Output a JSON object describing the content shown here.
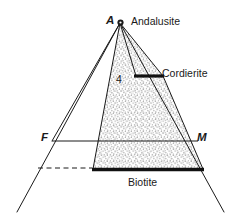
{
  "figure": {
    "type": "afm-phase-diagram",
    "background_color": "#ffffff",
    "line_color": "#1a1a1a",
    "stipple_color": "#8a8a8a",
    "labels": {
      "apex_symbol": "A",
      "apex_phase": "Andalusite",
      "cordierite": "Cordierite",
      "biotite": "Biotite",
      "left_corner": "F",
      "right_corner": "M",
      "field_number": "4"
    },
    "geometry": {
      "apex": [
        120,
        23
      ],
      "outer_left_base": [
        17,
        212
      ],
      "outer_right_base": [
        224,
        212
      ],
      "f_point": [
        52,
        141
      ],
      "m_point": [
        193,
        141
      ],
      "biotite_bar_left": [
        93,
        169
      ],
      "biotite_bar_right": [
        203,
        169
      ],
      "cordierite_bar_left": [
        136,
        76
      ],
      "cordierite_bar_right": [
        163,
        76
      ],
      "dashed_line_start": [
        38,
        168
      ],
      "dashed_line_end": [
        93,
        168
      ]
    }
  }
}
